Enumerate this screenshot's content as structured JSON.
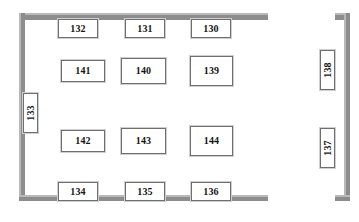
{
  "plan": {
    "title": "Exhibition Floor Plan",
    "wall_color": "#8d8d8d",
    "wall_highlight_color": "#b9b9b9",
    "booth_border_color": "#6f6f6f",
    "booth_fill_color": "#ffffff",
    "label_color": "#141414",
    "background_color": "#ffffff"
  },
  "walls": [
    {
      "name": "main-room-top-wall",
      "x": 19,
      "y": 13,
      "w": 249,
      "h": 7
    },
    {
      "name": "main-room-left-wall",
      "x": 19,
      "y": 13,
      "w": 6,
      "h": 188
    },
    {
      "name": "main-room-bottom-wall",
      "x": 19,
      "y": 195,
      "w": 249,
      "h": 6
    },
    {
      "name": "corridor-top-stub",
      "x": 335,
      "y": 13,
      "w": 15,
      "h": 7
    },
    {
      "name": "corridor-right-wall",
      "x": 344,
      "y": 13,
      "w": 6,
      "h": 188
    },
    {
      "name": "corridor-bottom-stub",
      "x": 335,
      "y": 195,
      "w": 15,
      "h": 6
    }
  ],
  "booths": [
    {
      "name": "booth-132",
      "label": "132",
      "x": 58,
      "y": 19,
      "w": 40,
      "h": 19,
      "orientation": "horizontal"
    },
    {
      "name": "booth-131",
      "label": "131",
      "x": 125,
      "y": 19,
      "w": 40,
      "h": 19,
      "orientation": "horizontal"
    },
    {
      "name": "booth-130",
      "label": "130",
      "x": 191,
      "y": 19,
      "w": 40,
      "h": 19,
      "orientation": "horizontal"
    },
    {
      "name": "booth-141",
      "label": "141",
      "x": 61,
      "y": 60,
      "w": 44,
      "h": 22,
      "orientation": "horizontal"
    },
    {
      "name": "booth-140",
      "label": "140",
      "x": 121,
      "y": 58,
      "w": 45,
      "h": 26,
      "orientation": "horizontal"
    },
    {
      "name": "booth-139",
      "label": "139",
      "x": 190,
      "y": 56,
      "w": 43,
      "h": 30,
      "orientation": "horizontal"
    },
    {
      "name": "booth-142",
      "label": "142",
      "x": 61,
      "y": 130,
      "w": 44,
      "h": 22,
      "orientation": "horizontal"
    },
    {
      "name": "booth-143",
      "label": "143",
      "x": 121,
      "y": 128,
      "w": 45,
      "h": 26,
      "orientation": "horizontal"
    },
    {
      "name": "booth-144",
      "label": "144",
      "x": 190,
      "y": 126,
      "w": 43,
      "h": 30,
      "orientation": "horizontal"
    },
    {
      "name": "booth-134",
      "label": "134",
      "x": 58,
      "y": 182,
      "w": 40,
      "h": 19,
      "orientation": "horizontal"
    },
    {
      "name": "booth-135",
      "label": "135",
      "x": 125,
      "y": 182,
      "w": 40,
      "h": 19,
      "orientation": "horizontal"
    },
    {
      "name": "booth-136",
      "label": "136",
      "x": 191,
      "y": 182,
      "w": 40,
      "h": 19,
      "orientation": "horizontal"
    },
    {
      "name": "booth-133",
      "label": "133",
      "x": 23,
      "y": 93,
      "w": 15,
      "h": 40,
      "orientation": "vertical"
    },
    {
      "name": "booth-138",
      "label": "138",
      "x": 320,
      "y": 50,
      "w": 15,
      "h": 40,
      "orientation": "vertical"
    },
    {
      "name": "booth-137",
      "label": "137",
      "x": 320,
      "y": 128,
      "w": 15,
      "h": 40,
      "orientation": "vertical"
    }
  ]
}
